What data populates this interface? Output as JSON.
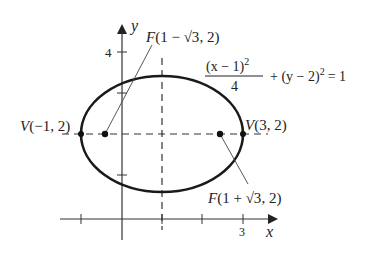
{
  "figure": {
    "type": "ellipse-diagram",
    "equation": {
      "numerator": "(x − 1)",
      "numerator_exp": "2",
      "denominator": "4",
      "rest": "+ (y − 2)",
      "rest_exp": "2",
      "equals": "= 1"
    },
    "axes": {
      "x_label": "x",
      "y_label": "y",
      "x_tick_label": "3",
      "y_tick_label": "4"
    },
    "points": {
      "vertex_left": {
        "label": "V(−1, 2)"
      },
      "vertex_right": {
        "label": "V(3, 2)"
      },
      "focus_left": {
        "label_pre": "F(1 − ",
        "label_rad": "√3",
        "label_post": ", 2)"
      },
      "focus_right": {
        "label_pre": "F(1 + ",
        "label_rad": "√3",
        "label_post": ", 2)"
      }
    },
    "colors": {
      "curve": "#1a1a1a",
      "axis": "#333333",
      "text": "#222222"
    }
  }
}
